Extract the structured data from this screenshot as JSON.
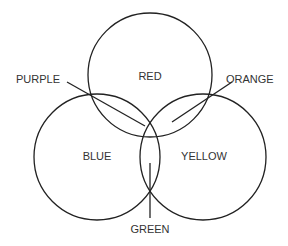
{
  "diagram": {
    "type": "venn",
    "stroke_color": "#222222",
    "circles": [
      {
        "name": "red",
        "label": "RED"
      },
      {
        "name": "blue",
        "label": "BLUE"
      },
      {
        "name": "yellow",
        "label": "YELLOW"
      }
    ],
    "callouts": [
      {
        "name": "purple",
        "label": "PURPLE"
      },
      {
        "name": "orange",
        "label": "ORANGE"
      },
      {
        "name": "green",
        "label": "GREEN"
      }
    ]
  }
}
